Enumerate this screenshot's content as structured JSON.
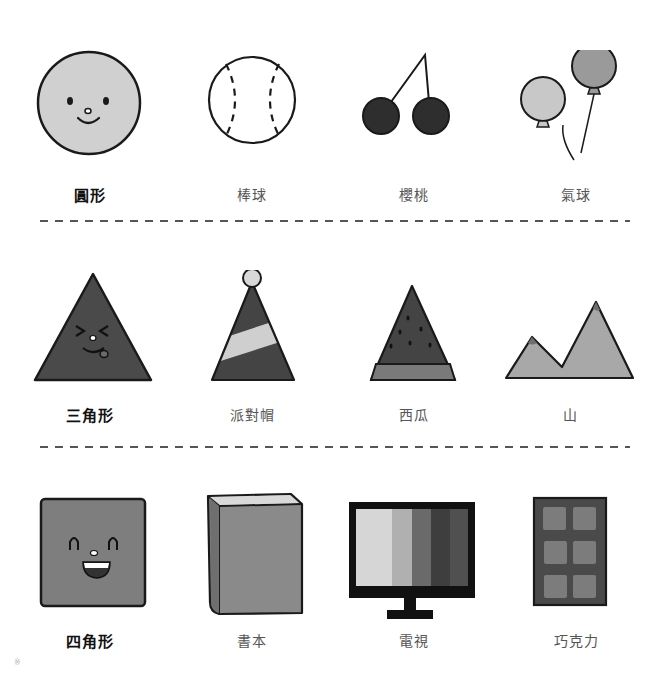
{
  "rows": [
    {
      "name": "circle",
      "items": [
        {
          "label": "圓形",
          "kind": "circle-face",
          "main": true
        },
        {
          "label": "棒球",
          "kind": "baseball"
        },
        {
          "label": "櫻桃",
          "kind": "cherries"
        },
        {
          "label": "氣球",
          "kind": "balloons"
        }
      ]
    },
    {
      "name": "triangle",
      "items": [
        {
          "label": "三角形",
          "kind": "triangle-face",
          "main": true
        },
        {
          "label": "派對帽",
          "kind": "party-hat"
        },
        {
          "label": "西瓜",
          "kind": "watermelon"
        },
        {
          "label": "山",
          "kind": "mountains"
        }
      ]
    },
    {
      "name": "square",
      "items": [
        {
          "label": "四角形",
          "kind": "square-face",
          "main": true
        },
        {
          "label": "書本",
          "kind": "book"
        },
        {
          "label": "電視",
          "kind": "tv"
        },
        {
          "label": "巧克力",
          "kind": "chocolate"
        }
      ]
    }
  ],
  "colors": {
    "outline": "#1a1a1a",
    "circle_fill": "#d0d0d0",
    "cherry_fill": "#2e2e2e",
    "balloon_light": "#c8c8c8",
    "balloon_dark": "#9a9a9a",
    "triangle_fill": "#4a4a4a",
    "hat_stripe": "#cfcfcf",
    "watermelon_flesh": "#444444",
    "watermelon_rind": "#7a7a7a",
    "mountain_fill": "#a8a8a8",
    "square_fill": "#7e7e7e",
    "book_fill": "#8a8a8a",
    "chocolate_case": "#4a4a4a",
    "chocolate_piece": "#7c7c7c",
    "tv_bars": [
      "#d6d6d6",
      "#b0b0b0",
      "#6a6a6a",
      "#3e3e3e",
      "#505050"
    ],
    "divider": "#555555",
    "label_main": "#111111",
    "label_sub": "#555555"
  },
  "corner_mark": "※"
}
